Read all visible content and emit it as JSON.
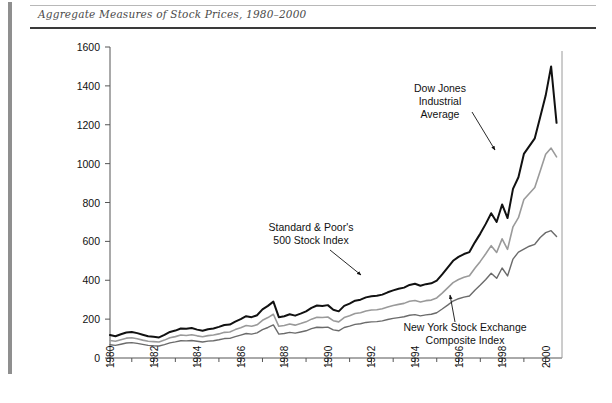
{
  "figure": {
    "caption": "Aggregate Measures of Stock Prices, 1980–2000"
  },
  "chart_data": {
    "type": "line",
    "title": "Aggregate Measures of Stock Prices, 1980–2000",
    "xlabel": "",
    "ylabel": "",
    "xlim": [
      1980,
      2000.75
    ],
    "ylim": [
      0,
      1600
    ],
    "grid": false,
    "legend_position": "inline-annotations",
    "y_ticks": [
      0,
      200,
      400,
      600,
      800,
      1000,
      1200,
      1400,
      1600
    ],
    "x_ticks_major": [
      1980,
      1982,
      1984,
      1986,
      1988,
      1990,
      1992,
      1994,
      1996,
      1998,
      2000
    ],
    "x_ticks_minor": [
      1981,
      1983,
      1985,
      1987,
      1989,
      1991,
      1993,
      1995,
      1997,
      1999
    ],
    "x_tick_labels": [
      "1980",
      "1982",
      "1984",
      "1986",
      "1988",
      "1990",
      "1992",
      "1994",
      "1996",
      "1998",
      "2000"
    ],
    "x_tick_label_rotation": -90,
    "x": [
      1980.0,
      1980.25,
      1980.5,
      1980.75,
      1981.0,
      1981.25,
      1981.5,
      1981.75,
      1982.0,
      1982.25,
      1982.5,
      1982.75,
      1983.0,
      1983.25,
      1983.5,
      1983.75,
      1984.0,
      1984.25,
      1984.5,
      1984.75,
      1985.0,
      1985.25,
      1985.5,
      1985.75,
      1986.0,
      1986.25,
      1986.5,
      1986.75,
      1987.0,
      1987.25,
      1987.5,
      1987.75,
      1988.0,
      1988.25,
      1988.5,
      1988.75,
      1989.0,
      1989.25,
      1989.5,
      1989.75,
      1990.0,
      1990.25,
      1990.5,
      1990.75,
      1991.0,
      1991.25,
      1991.5,
      1991.75,
      1992.0,
      1992.25,
      1992.5,
      1992.75,
      1993.0,
      1993.25,
      1993.5,
      1993.75,
      1994.0,
      1994.25,
      1994.5,
      1994.75,
      1995.0,
      1995.25,
      1995.5,
      1995.75,
      1996.0,
      1996.25,
      1996.5,
      1996.75,
      1997.0,
      1997.25,
      1997.5,
      1997.75,
      1998.0,
      1998.25,
      1998.5,
      1998.75,
      1999.0,
      1999.25,
      1999.5,
      1999.75,
      2000.0,
      2000.25,
      2000.5
    ],
    "series": [
      {
        "name": "Dow Jones Industrial Average",
        "color": "#111111",
        "linewidth": 2.0,
        "annotation": "Dow Jones\nIndustrial\nAverage",
        "values": [
          118,
          112,
          122,
          131,
          134,
          128,
          120,
          112,
          109,
          106,
          119,
          134,
          141,
          152,
          150,
          154,
          146,
          140,
          148,
          152,
          160,
          170,
          172,
          187,
          200,
          215,
          210,
          220,
          250,
          268,
          290,
          210,
          215,
          225,
          218,
          228,
          240,
          258,
          270,
          268,
          272,
          248,
          240,
          268,
          280,
          295,
          300,
          312,
          318,
          320,
          326,
          338,
          348,
          356,
          362,
          376,
          382,
          372,
          380,
          384,
          398,
          430,
          465,
          500,
          520,
          535,
          545,
          595,
          640,
          690,
          745,
          700,
          790,
          720,
          870,
          930,
          1050,
          1090,
          1130,
          1240,
          1350,
          1500,
          1210
        ]
      },
      {
        "name": "Standard & Poor's 500 Stock Index",
        "color": "#9a9a9a",
        "linewidth": 1.6,
        "annotation": "Standard & Poor's\n500 Stock Index",
        "values": [
          90,
          86,
          94,
          102,
          104,
          99,
          92,
          86,
          84,
          82,
          92,
          104,
          110,
          118,
          116,
          120,
          114,
          109,
          115,
          118,
          124,
          132,
          134,
          146,
          156,
          167,
          163,
          171,
          194,
          208,
          225,
          163,
          167,
          175,
          169,
          177,
          186,
          200,
          210,
          208,
          211,
          192,
          186,
          208,
          217,
          229,
          233,
          242,
          247,
          248,
          253,
          262,
          270,
          276,
          281,
          292,
          296,
          288,
          295,
          298,
          309,
          334,
          361,
          388,
          404,
          415,
          423,
          462,
          497,
          536,
          578,
          543,
          613,
          559,
          675,
          722,
          815,
          846,
          877,
          962,
          1048,
          1080,
          1035
        ]
      },
      {
        "name": "New York Stock Exchange Composite Index",
        "color": "#6b6b6b",
        "linewidth": 1.4,
        "annotation": "New York Stock Exchange\nComposite Index",
        "values": [
          68,
          65,
          71,
          77,
          79,
          75,
          70,
          65,
          63,
          62,
          69,
          78,
          83,
          89,
          88,
          90,
          86,
          82,
          87,
          89,
          94,
          100,
          101,
          110,
          118,
          126,
          123,
          129,
          146,
          157,
          170,
          123,
          126,
          132,
          128,
          134,
          140,
          151,
          158,
          157,
          159,
          145,
          140,
          157,
          164,
          173,
          176,
          183,
          186,
          187,
          191,
          198,
          204,
          208,
          212,
          220,
          223,
          217,
          222,
          225,
          233,
          252,
          272,
          293,
          305,
          313,
          319,
          349,
          375,
          404,
          436,
          410,
          463,
          422,
          509,
          545,
          560,
          575,
          585,
          620,
          645,
          655,
          625
        ]
      }
    ]
  },
  "annotations": [
    {
      "id": "dow-jones-label",
      "lines": [
        "Dow Jones",
        "Industrial",
        "Average"
      ],
      "target_series": "Dow Jones Industrial Average"
    },
    {
      "id": "sp500-label",
      "lines": [
        "Standard & Poor's",
        "500 Stock Index"
      ],
      "target_series": "Standard & Poor's 500 Stock Index"
    },
    {
      "id": "nyse-label",
      "lines": [
        "New York Stock Exchange",
        "Composite Index"
      ],
      "target_series": "New York Stock Exchange Composite Index"
    }
  ]
}
